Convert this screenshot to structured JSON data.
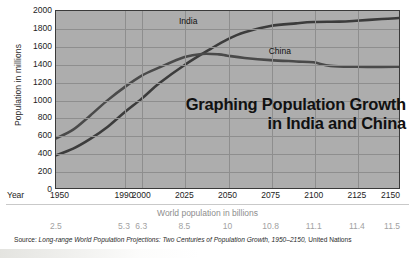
{
  "chart_data": {
    "type": "line",
    "title": "Graphing Population Growth in India and China",
    "title_line1": "Graphing Population Growth",
    "title_line2": "in India and China",
    "xlabel": "Year",
    "ylabel": "Population in millions",
    "secondary_xlabel": "World population in billions",
    "ylim": [
      0,
      2000
    ],
    "xlim": [
      1950,
      2150
    ],
    "grid": true,
    "legend_position": "inline-labels",
    "ytick_labels": [
      "2000",
      "1800",
      "1600",
      "1400",
      "1200",
      "1000",
      "800",
      "600",
      "400",
      "200",
      "0"
    ],
    "ytick_values": [
      2000,
      1800,
      1600,
      1400,
      1200,
      1000,
      800,
      600,
      400,
      200,
      0
    ],
    "xtick_labels": [
      "1950",
      "1990",
      "2000",
      "2025",
      "2050",
      "2075",
      "2100",
      "2125",
      "2150"
    ],
    "xtick_values": [
      1950,
      1990,
      2000,
      2025,
      2050,
      2075,
      2100,
      2125,
      2150
    ],
    "world_population_billions": [
      "2.5",
      "5.3",
      "6.3",
      "8.5",
      "10",
      "10.8",
      "11.1",
      "11.4",
      "11.5"
    ],
    "series": [
      {
        "name": "India",
        "color": "#3c3c3c",
        "label_x": 2030,
        "label_y": 1880,
        "x": [
          1950,
          1960,
          1970,
          1980,
          1990,
          2000,
          2010,
          2025,
          2040,
          2050,
          2060,
          2075,
          2090,
          2100,
          2115,
          2125,
          2140,
          2150
        ],
        "values": [
          370,
          445,
          555,
          690,
          855,
          1010,
          1180,
          1390,
          1570,
          1680,
          1760,
          1830,
          1860,
          1875,
          1880,
          1890,
          1910,
          1920
        ]
      },
      {
        "name": "China",
        "color": "#4a4a4a",
        "label_x": 2082,
        "label_y": 1540,
        "x": [
          1950,
          1960,
          1970,
          1980,
          1990,
          2000,
          2010,
          2025,
          2035,
          2045,
          2050,
          2060,
          2075,
          2090,
          2100,
          2110,
          2125,
          2140,
          2150
        ],
        "values": [
          560,
          660,
          820,
          990,
          1140,
          1270,
          1360,
          1480,
          1515,
          1510,
          1495,
          1470,
          1445,
          1430,
          1420,
          1380,
          1370,
          1368,
          1370
        ]
      }
    ],
    "annotations": {
      "crossover_year": 2030,
      "crossover_value": 1510
    }
  },
  "source": {
    "prefix": "Source:",
    "italic_part": "Long-range World Population Projections: Two Centuries of Population Growth, 1950–2150,",
    "suffix": "United Nations"
  }
}
